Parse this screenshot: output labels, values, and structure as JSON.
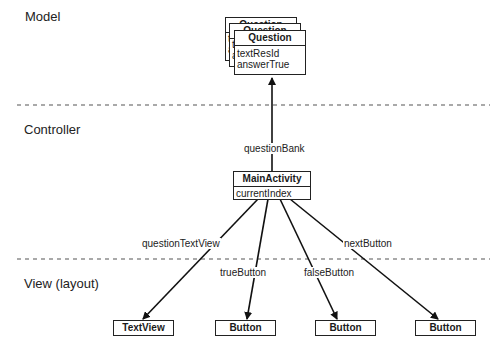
{
  "layers": {
    "model": "Model",
    "controller": "Controller",
    "view": "View (layout)"
  },
  "model": {
    "class_name": "Question",
    "stack_count": 3,
    "fields": [
      "textResId",
      "answerTrue"
    ],
    "back_peek": [
      "te",
      "a"
    ],
    "back2_peek": [
      "t",
      "a"
    ]
  },
  "controller": {
    "class_name": "MainActivity",
    "fields": [
      "currentIndex"
    ]
  },
  "edges": {
    "question_bank": "questionBank",
    "question_text_view": "questionTextView",
    "true_button": "trueButton",
    "false_button": "falseButton",
    "next_button": "nextButton"
  },
  "views": [
    {
      "label": "TextView"
    },
    {
      "label": "Button"
    },
    {
      "label": "Button"
    },
    {
      "label": "Button"
    }
  ],
  "colors": {
    "line": "#111111",
    "divider": "#555555",
    "background": "#ffffff"
  }
}
